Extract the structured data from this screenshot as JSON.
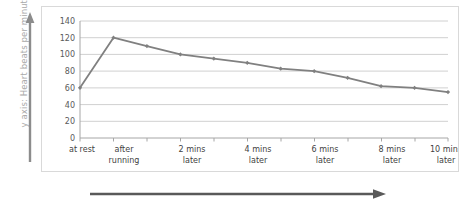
{
  "chart_data": {
    "type": "line",
    "title": "",
    "xlabel": "",
    "ylabel": "y axis: Heart beats per minute",
    "ylim": [
      0,
      140
    ],
    "ytick_step": 20,
    "yticks": [
      "0",
      "20",
      "40",
      "60",
      "80",
      "100",
      "120",
      "140"
    ],
    "grid": true,
    "legend": false,
    "categories": [
      "at rest",
      "after running",
      "",
      "2 mins later",
      "",
      "4 mins later",
      "",
      "6 mins later",
      "",
      "8 mins later",
      "",
      "10 mins later"
    ],
    "tick_labels_visible": [
      "at rest",
      "after\nrunning",
      "",
      "2 mins\nlater",
      "",
      "4 mins\nlater",
      "",
      "6 mins\nlater",
      "",
      "8 mins\nlater",
      "",
      "10 mins\nlater"
    ],
    "values": [
      60,
      120,
      110,
      100,
      95,
      90,
      83,
      80,
      72,
      62,
      60,
      55
    ],
    "series": [
      {
        "name": "Heart rate",
        "values": [
          60,
          120,
          110,
          100,
          95,
          90,
          83,
          80,
          72,
          62,
          60,
          55
        ]
      }
    ],
    "line_color": "#808080",
    "marker_color": "#808080",
    "grid_color": "#d0d0d0",
    "axis_color": "#a6a6a6"
  },
  "axis_labels": {
    "y_caption": "y axis: Heart beats per minute"
  },
  "xtick_labels": [
    {
      "line1": "at rest",
      "line2": ""
    },
    {
      "line1": "after",
      "line2": "running"
    },
    {
      "line1": "2 mins",
      "line2": "later"
    },
    {
      "line1": "4 mins",
      "line2": "later"
    },
    {
      "line1": "6 mins",
      "line2": "later"
    },
    {
      "line1": "8 mins",
      "line2": "later"
    },
    {
      "line1": "10 mins",
      "line2": "later"
    }
  ],
  "ytick_labels": [
    "140",
    "120",
    "100",
    "80",
    "60",
    "40",
    "20",
    "0"
  ],
  "colors": {
    "arrow": "#595959",
    "y_caption": "#a9a9a9",
    "line": "#808080",
    "grid": "#d0d0d0",
    "frame": "#d9d9d9"
  }
}
